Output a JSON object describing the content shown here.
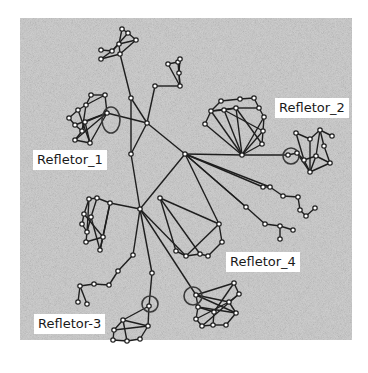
{
  "diagram": {
    "type": "network-topology",
    "background": {
      "x": 20,
      "y": 18,
      "w": 332,
      "h": 322,
      "color": "#c9c9c9"
    },
    "colors": {
      "edge": "#1e1e1e",
      "node_fill": "#ffffff",
      "node_stroke": "#1e1e1e",
      "label_bg": "#ffffff",
      "label_text": "#1a1a1a"
    },
    "labels": [
      {
        "id": "refletor_1",
        "text": "Refletor_1",
        "x": 33,
        "y": 152
      },
      {
        "id": "refletor_2",
        "text": "Refletor_2",
        "x": 276,
        "y": 100
      },
      {
        "id": "refletor_3",
        "text": "Refletor-3",
        "x": 35,
        "y": 316
      },
      {
        "id": "refletor_4",
        "text": "Refletor_4",
        "x": 227,
        "y": 254
      }
    ],
    "highlight_circles": [
      {
        "id": "c1",
        "cx": 111,
        "cy": 120,
        "rx": 9,
        "ry": 13
      },
      {
        "id": "c2",
        "cx": 291,
        "cy": 156,
        "rx": 8,
        "ry": 8
      },
      {
        "id": "c3",
        "cx": 150,
        "cy": 304,
        "rx": 8,
        "ry": 8
      },
      {
        "id": "c4",
        "cx": 193,
        "cy": 296,
        "rx": 9,
        "ry": 9
      },
      {
        "id": "c5",
        "cx": 258,
        "cy": 154,
        "rx": 0,
        "ry": 0
      }
    ],
    "nodes": [
      {
        "id": "h1",
        "x": 147,
        "y": 123
      },
      {
        "id": "h2",
        "x": 185,
        "y": 154
      },
      {
        "id": "h3",
        "x": 140,
        "y": 209
      },
      {
        "id": "m1",
        "x": 131,
        "y": 98
      },
      {
        "id": "m2",
        "x": 131,
        "y": 154
      },
      {
        "id": "m3",
        "x": 160,
        "y": 198
      },
      {
        "id": "t1",
        "x": 122,
        "y": 29
      },
      {
        "id": "t2",
        "x": 128,
        "y": 33
      },
      {
        "id": "t3",
        "x": 136,
        "y": 40
      },
      {
        "id": "t4",
        "x": 119,
        "y": 44
      },
      {
        "id": "t5",
        "x": 112,
        "y": 51
      },
      {
        "id": "t6",
        "x": 101,
        "y": 50
      },
      {
        "id": "t7",
        "x": 101,
        "y": 59
      },
      {
        "id": "t8",
        "x": 120,
        "y": 54
      },
      {
        "id": "u1",
        "x": 155,
        "y": 86
      },
      {
        "id": "u2",
        "x": 168,
        "y": 64
      },
      {
        "id": "u3",
        "x": 178,
        "y": 62
      },
      {
        "id": "u4",
        "x": 180,
        "y": 59
      },
      {
        "id": "u5",
        "x": 179,
        "y": 73
      },
      {
        "id": "u6",
        "x": 180,
        "y": 86
      },
      {
        "id": "a1",
        "x": 91,
        "y": 95
      },
      {
        "id": "a2",
        "x": 105,
        "y": 95
      },
      {
        "id": "a3",
        "x": 86,
        "y": 105
      },
      {
        "id": "a4",
        "x": 78,
        "y": 110
      },
      {
        "id": "a5",
        "x": 69,
        "y": 118
      },
      {
        "id": "a6",
        "x": 75,
        "y": 125
      },
      {
        "id": "a7",
        "x": 82,
        "y": 131
      },
      {
        "id": "a8",
        "x": 75,
        "y": 140
      },
      {
        "id": "a9",
        "x": 90,
        "y": 143
      },
      {
        "id": "a10",
        "x": 107,
        "y": 113
      },
      {
        "id": "a11",
        "x": 85,
        "y": 122
      },
      {
        "id": "b1",
        "x": 221,
        "y": 101
      },
      {
        "id": "b2",
        "x": 240,
        "y": 99
      },
      {
        "id": "b3",
        "x": 254,
        "y": 98
      },
      {
        "id": "b4",
        "x": 259,
        "y": 108
      },
      {
        "id": "b5",
        "x": 264,
        "y": 117
      },
      {
        "id": "b6",
        "x": 263,
        "y": 131
      },
      {
        "id": "b7",
        "x": 262,
        "y": 144
      },
      {
        "id": "b8",
        "x": 242,
        "y": 155
      },
      {
        "id": "b9",
        "x": 205,
        "y": 124
      },
      {
        "id": "b10",
        "x": 211,
        "y": 111
      },
      {
        "id": "b11",
        "x": 224,
        "y": 110
      },
      {
        "id": "b12",
        "x": 236,
        "y": 108
      },
      {
        "id": "r1",
        "x": 288,
        "y": 155
      },
      {
        "id": "r2",
        "x": 297,
        "y": 153
      },
      {
        "id": "r3",
        "x": 296,
        "y": 133
      },
      {
        "id": "r4",
        "x": 310,
        "y": 139
      },
      {
        "id": "r5",
        "x": 320,
        "y": 130
      },
      {
        "id": "r6",
        "x": 332,
        "y": 136
      },
      {
        "id": "r7",
        "x": 324,
        "y": 146
      },
      {
        "id": "r8",
        "x": 330,
        "y": 163
      },
      {
        "id": "r9",
        "x": 310,
        "y": 172
      },
      {
        "id": "r10",
        "x": 304,
        "y": 160
      },
      {
        "id": "r11",
        "x": 316,
        "y": 156
      },
      {
        "id": "d1",
        "x": 270,
        "y": 187
      },
      {
        "id": "d2",
        "x": 283,
        "y": 196
      },
      {
        "id": "d3",
        "x": 298,
        "y": 197
      },
      {
        "id": "d4",
        "x": 300,
        "y": 210
      },
      {
        "id": "d5",
        "x": 306,
        "y": 216
      },
      {
        "id": "d6",
        "x": 315,
        "y": 208
      },
      {
        "id": "d7",
        "x": 246,
        "y": 207
      },
      {
        "id": "d8",
        "x": 265,
        "y": 224
      },
      {
        "id": "d9",
        "x": 280,
        "y": 226
      },
      {
        "id": "d10",
        "x": 280,
        "y": 239
      },
      {
        "id": "d11",
        "x": 293,
        "y": 230
      },
      {
        "id": "d12",
        "x": 263,
        "y": 187
      },
      {
        "id": "e1",
        "x": 89,
        "y": 199
      },
      {
        "id": "e2",
        "x": 97,
        "y": 198
      },
      {
        "id": "e3",
        "x": 110,
        "y": 203
      },
      {
        "id": "e4",
        "x": 84,
        "y": 214
      },
      {
        "id": "e5",
        "x": 82,
        "y": 224
      },
      {
        "id": "e6",
        "x": 87,
        "y": 232
      },
      {
        "id": "e7",
        "x": 86,
        "y": 242
      },
      {
        "id": "e8",
        "x": 103,
        "y": 237
      },
      {
        "id": "e9",
        "x": 100,
        "y": 250
      },
      {
        "id": "e10",
        "x": 91,
        "y": 217
      },
      {
        "id": "f1",
        "x": 219,
        "y": 224
      },
      {
        "id": "f2",
        "x": 222,
        "y": 242
      },
      {
        "id": "f3",
        "x": 200,
        "y": 254
      },
      {
        "id": "f4",
        "x": 186,
        "y": 256
      },
      {
        "id": "f5",
        "x": 176,
        "y": 251
      },
      {
        "id": "f6",
        "x": 208,
        "y": 256
      },
      {
        "id": "g1",
        "x": 133,
        "y": 255
      },
      {
        "id": "g2",
        "x": 118,
        "y": 271
      },
      {
        "id": "g3",
        "x": 109,
        "y": 285
      },
      {
        "id": "g4",
        "x": 94,
        "y": 284
      },
      {
        "id": "g5",
        "x": 80,
        "y": 286
      },
      {
        "id": "g6",
        "x": 78,
        "y": 302
      },
      {
        "id": "g7",
        "x": 87,
        "y": 304
      },
      {
        "id": "k1",
        "x": 152,
        "y": 273
      },
      {
        "id": "k2",
        "x": 149,
        "y": 306
      },
      {
        "id": "k3",
        "x": 123,
        "y": 320
      },
      {
        "id": "k4",
        "x": 114,
        "y": 330
      },
      {
        "id": "k5",
        "x": 113,
        "y": 340
      },
      {
        "id": "k6",
        "x": 127,
        "y": 341
      },
      {
        "id": "k7",
        "x": 140,
        "y": 339
      },
      {
        "id": "k8",
        "x": 148,
        "y": 326
      },
      {
        "id": "n1",
        "x": 196,
        "y": 295
      },
      {
        "id": "n2",
        "x": 234,
        "y": 283
      },
      {
        "id": "n3",
        "x": 239,
        "y": 294
      },
      {
        "id": "n4",
        "x": 229,
        "y": 302
      },
      {
        "id": "n5",
        "x": 236,
        "y": 313
      },
      {
        "id": "n6",
        "x": 226,
        "y": 325
      },
      {
        "id": "n7",
        "x": 213,
        "y": 325
      },
      {
        "id": "n8",
        "x": 202,
        "y": 326
      },
      {
        "id": "n9",
        "x": 196,
        "y": 319
      },
      {
        "id": "n10",
        "x": 198,
        "y": 307
      },
      {
        "id": "n11",
        "x": 214,
        "y": 312
      }
    ],
    "edges": [
      [
        "h1",
        "m1"
      ],
      [
        "m1",
        "t8"
      ],
      [
        "h1",
        "h2"
      ],
      [
        "h1",
        "a10"
      ],
      [
        "h1",
        "m2"
      ],
      [
        "h1",
        "u1"
      ],
      [
        "m2",
        "h3"
      ],
      [
        "h2",
        "h3"
      ],
      [
        "h2",
        "b8"
      ],
      [
        "h2",
        "d12"
      ],
      [
        "h2",
        "d7"
      ],
      [
        "h2",
        "f1"
      ],
      [
        "b8",
        "r1"
      ],
      [
        "m1",
        "m2"
      ],
      [
        "t1",
        "t2"
      ],
      [
        "t2",
        "t3"
      ],
      [
        "t3",
        "t8"
      ],
      [
        "t1",
        "t4"
      ],
      [
        "t4",
        "t5"
      ],
      [
        "t5",
        "t6"
      ],
      [
        "t5",
        "t7"
      ],
      [
        "t4",
        "t8"
      ],
      [
        "t2",
        "t5"
      ],
      [
        "t4",
        "t3"
      ],
      [
        "t7",
        "t8"
      ],
      [
        "u1",
        "u6"
      ],
      [
        "u2",
        "u3"
      ],
      [
        "u3",
        "u4"
      ],
      [
        "u4",
        "u5"
      ],
      [
        "u5",
        "u6"
      ],
      [
        "u2",
        "u6"
      ],
      [
        "u3",
        "u6"
      ],
      [
        "a1",
        "a2"
      ],
      [
        "a1",
        "a3"
      ],
      [
        "a2",
        "a3"
      ],
      [
        "a3",
        "a4"
      ],
      [
        "a4",
        "a5"
      ],
      [
        "a5",
        "a6"
      ],
      [
        "a6",
        "a7"
      ],
      [
        "a7",
        "a8"
      ],
      [
        "a8",
        "a9"
      ],
      [
        "a9",
        "a10"
      ],
      [
        "a2",
        "a10"
      ],
      [
        "a10",
        "a11"
      ],
      [
        "a10",
        "a6"
      ],
      [
        "a10",
        "a8"
      ],
      [
        "a11",
        "a7"
      ],
      [
        "a4",
        "a9"
      ],
      [
        "a3",
        "a7"
      ],
      [
        "a11",
        "a9"
      ],
      [
        "b1",
        "b2"
      ],
      [
        "b2",
        "b3"
      ],
      [
        "b3",
        "b4"
      ],
      [
        "b4",
        "b5"
      ],
      [
        "b5",
        "b6"
      ],
      [
        "b6",
        "b7"
      ],
      [
        "b7",
        "b8"
      ],
      [
        "b8",
        "b9"
      ],
      [
        "b9",
        "b10"
      ],
      [
        "b10",
        "b11"
      ],
      [
        "b11",
        "b12"
      ],
      [
        "b12",
        "b4"
      ],
      [
        "b11",
        "b8"
      ],
      [
        "b12",
        "b8"
      ],
      [
        "b10",
        "b8"
      ],
      [
        "b5",
        "b8"
      ],
      [
        "b6",
        "b8"
      ],
      [
        "b1",
        "b10"
      ],
      [
        "b12",
        "b7"
      ],
      [
        "b10",
        "b12"
      ],
      [
        "b11",
        "b6"
      ],
      [
        "r1",
        "r2"
      ],
      [
        "r2",
        "r10"
      ],
      [
        "r10",
        "r3"
      ],
      [
        "r10",
        "r11"
      ],
      [
        "r11",
        "r5"
      ],
      [
        "r3",
        "r4"
      ],
      [
        "r4",
        "r5"
      ],
      [
        "r5",
        "r6"
      ],
      [
        "r5",
        "r7"
      ],
      [
        "r7",
        "r8"
      ],
      [
        "r8",
        "r9"
      ],
      [
        "r9",
        "r10"
      ],
      [
        "r11",
        "r8"
      ],
      [
        "r4",
        "r9"
      ],
      [
        "r2",
        "r9"
      ],
      [
        "r11",
        "r9"
      ],
      [
        "h2",
        "d1"
      ],
      [
        "d1",
        "d12"
      ],
      [
        "d1",
        "d2"
      ],
      [
        "d2",
        "d3"
      ],
      [
        "d3",
        "d4"
      ],
      [
        "d4",
        "d5"
      ],
      [
        "d5",
        "d6"
      ],
      [
        "h2",
        "d7"
      ],
      [
        "d7",
        "d8"
      ],
      [
        "d8",
        "d9"
      ],
      [
        "d9",
        "d10"
      ],
      [
        "d9",
        "d11"
      ],
      [
        "h3",
        "e3"
      ],
      [
        "e1",
        "e2"
      ],
      [
        "e2",
        "e3"
      ],
      [
        "e1",
        "e4"
      ],
      [
        "e4",
        "e5"
      ],
      [
        "e5",
        "e6"
      ],
      [
        "e6",
        "e7"
      ],
      [
        "e7",
        "e8"
      ],
      [
        "e8",
        "e9"
      ],
      [
        "e3",
        "e8"
      ],
      [
        "e2",
        "e10"
      ],
      [
        "e10",
        "e6"
      ],
      [
        "e3",
        "e9"
      ],
      [
        "e4",
        "e8"
      ],
      [
        "e10",
        "e9"
      ],
      [
        "e1",
        "e6"
      ],
      [
        "m3",
        "f1"
      ],
      [
        "f1",
        "f2"
      ],
      [
        "f2",
        "f6"
      ],
      [
        "f6",
        "f3"
      ],
      [
        "f3",
        "f4"
      ],
      [
        "f4",
        "f5"
      ],
      [
        "f1",
        "f4"
      ],
      [
        "m3",
        "f5"
      ],
      [
        "h3",
        "f4"
      ],
      [
        "m3",
        "f3"
      ],
      [
        "h3",
        "g1"
      ],
      [
        "g1",
        "g2"
      ],
      [
        "g2",
        "g3"
      ],
      [
        "g3",
        "g4"
      ],
      [
        "g4",
        "g5"
      ],
      [
        "g5",
        "g6"
      ],
      [
        "g5",
        "g7"
      ],
      [
        "h3",
        "k1"
      ],
      [
        "k1",
        "k2"
      ],
      [
        "k2",
        "k3"
      ],
      [
        "k2",
        "k8"
      ],
      [
        "k3",
        "k4"
      ],
      [
        "k4",
        "k5"
      ],
      [
        "k5",
        "k6"
      ],
      [
        "k6",
        "k7"
      ],
      [
        "k7",
        "k8"
      ],
      [
        "k3",
        "k8"
      ],
      [
        "k3",
        "k6"
      ],
      [
        "k8",
        "k4"
      ],
      [
        "h3",
        "n1"
      ],
      [
        "n1",
        "n2"
      ],
      [
        "n2",
        "n3"
      ],
      [
        "n3",
        "n4"
      ],
      [
        "n4",
        "n5"
      ],
      [
        "n5",
        "n6"
      ],
      [
        "n6",
        "n7"
      ],
      [
        "n7",
        "n8"
      ],
      [
        "n8",
        "n9"
      ],
      [
        "n9",
        "n10"
      ],
      [
        "n10",
        "n1"
      ],
      [
        "n1",
        "n4"
      ],
      [
        "n10",
        "n5"
      ],
      [
        "n9",
        "n4"
      ],
      [
        "n11",
        "n2"
      ],
      [
        "n11",
        "n7"
      ],
      [
        "n10",
        "n11"
      ],
      [
        "n1",
        "n5"
      ],
      [
        "n8",
        "n3"
      ]
    ]
  }
}
